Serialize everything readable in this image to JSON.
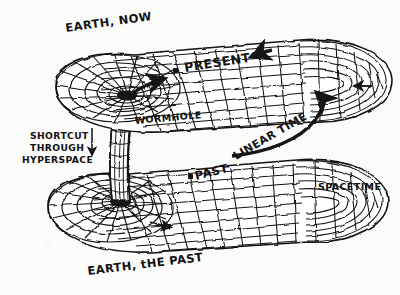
{
  "figure": {
    "kind": "hand-drawn-diagram",
    "ink_color": "#121212",
    "paper_color": "#fbfbfa"
  },
  "labels": {
    "earth_now": "EARTH, NOW",
    "present": "PRESENT",
    "wormhole": "WORMHOLE",
    "shortcut_line1": "SHORTCUT",
    "shortcut_line2": "THROUGH",
    "shortcut_line3": "HYPERSPACE",
    "past": "PAST",
    "linear_time": "LINEAR TIME",
    "spacetime": "SPACETIME",
    "earth_the_past": "EARTH, tHE PAST"
  },
  "markers": {
    "present_event_dot": "present-event-dot",
    "past_event_dot": "past-event-dot"
  },
  "arrows": {
    "wormhole_exit": "arrow from wormhole mouth onto present sheet",
    "present_flow": "arrow along present sheet pointing left",
    "linear_time": "curved arrow sweeping from past sheet around the bend up to the present sheet",
    "hyperspace_down": "downward arrow beside shortcut label",
    "past_flow": "arrow along past sheet pointing right",
    "far_edge": "arrow on far right edge pointing left"
  }
}
